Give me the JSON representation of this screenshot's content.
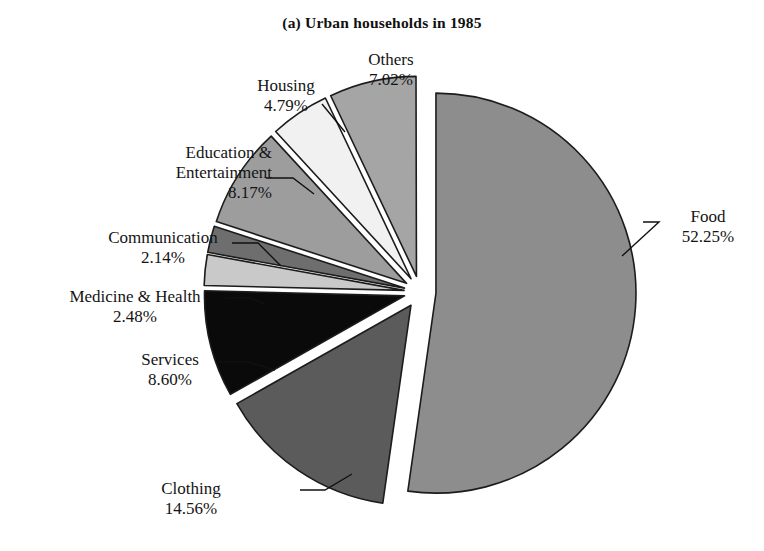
{
  "chart_title": "(a) Urban households in 1985",
  "chart_data": {
    "type": "pie",
    "title": "(a) Urban households in 1985",
    "xlabel": "",
    "ylabel": "",
    "units": "percent",
    "exploded": true,
    "legend_position": "none",
    "grid": false,
    "categories": [
      "Food",
      "Clothing",
      "Services",
      "Medicine & Health",
      "Communication",
      "Education & Entertainment",
      "Housing",
      "Others"
    ],
    "values": [
      52.25,
      14.56,
      8.6,
      2.48,
      2.14,
      8.17,
      4.79,
      7.02
    ],
    "value_labels": [
      "52.25%",
      "14.56%",
      "8.60%",
      "2.48%",
      "2.14%",
      "8.17%",
      "4.79%",
      "7.02%"
    ],
    "colors": [
      "#8d8d8d",
      "#5b5b5b",
      "#0a0a0a",
      "#c9c9c9",
      "#6e6e6e",
      "#9d9d9d",
      "#f1f1f1",
      "#a5a5a5"
    ],
    "stroke_color": "#1c1c1c",
    "slices": [
      {
        "name": "Food",
        "value": 52.25,
        "value_label": "52.25%",
        "color": "#8d8d8d",
        "start_angle": -90,
        "explode": 16,
        "label_x": 668,
        "label_y": 207,
        "align": "left",
        "leader": [
          [
            643,
            222
          ],
          [
            659,
            222
          ],
          [
            622,
            256
          ]
        ]
      },
      {
        "name": "Clothing",
        "value": 14.56,
        "value_label": "14.56%",
        "color": "#5b5b5b",
        "start_angle": 98.1,
        "explode": 16,
        "label_x": 136,
        "label_y": 479,
        "align": "left",
        "leader": [
          [
            300,
            490
          ],
          [
            325,
            490
          ],
          [
            352,
            474
          ]
        ]
      },
      {
        "name": "Services",
        "value": 8.6,
        "value_label": "8.60%",
        "color": "#0a0a0a",
        "start_angle": 150.5,
        "explode": 16,
        "label_x": 122,
        "label_y": 350,
        "align": "left",
        "leader": [
          [
            218,
            362
          ],
          [
            248,
            362
          ],
          [
            275,
            370
          ]
        ]
      },
      {
        "name": "Medicine & Health",
        "value": 2.48,
        "value_label": "2.48%",
        "color": "#c9c9c9",
        "start_angle": 181.4,
        "explode": 16,
        "label_x": 40,
        "label_y": 287,
        "align": "left",
        "leader": [
          [
            225,
            298
          ],
          [
            250,
            298
          ],
          [
            265,
            304
          ]
        ]
      },
      {
        "name": "Communication",
        "value": 2.14,
        "value_label": "2.14%",
        "color": "#6e6e6e",
        "start_angle": 190.3,
        "explode": 16,
        "label_x": 88,
        "label_y": 228,
        "align": "left",
        "leader": [
          [
            232,
            243
          ],
          [
            258,
            243
          ],
          [
            281,
            266
          ]
        ]
      },
      {
        "name": "Education & Entertainment",
        "value": 8.17,
        "value_label": "8.17%",
        "color": "#9d9d9d",
        "start_angle": 198.0,
        "explode": 16,
        "label_x": 112,
        "label_y": 143,
        "align": "right",
        "leader": [
          [
            266,
            178
          ],
          [
            293,
            178
          ],
          [
            314,
            194
          ]
        ]
      },
      {
        "name": "Housing",
        "value": 4.79,
        "value_label": "4.79%",
        "color": "#f1f1f1",
        "start_angle": 227.4,
        "explode": 16,
        "label_x": 236,
        "label_y": 76,
        "align": "center",
        "leader": [
          [
            322,
            104
          ],
          [
            345,
            132
          ]
        ]
      },
      {
        "name": "Others",
        "value": 7.02,
        "value_label": "7.02%",
        "color": "#a5a5a5",
        "start_angle": 244.6,
        "explode": 16,
        "label_x": 351,
        "label_y": 50,
        "align": "center",
        "leader": []
      }
    ],
    "geometry": {
      "center_x": 420,
      "center_y": 292,
      "radius": 200
    }
  }
}
